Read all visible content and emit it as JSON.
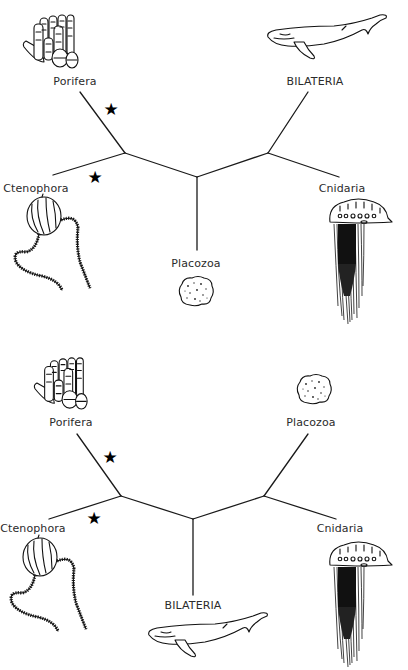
{
  "figure": {
    "type": "unrooted phylogenetic trees",
    "panels": [
      {
        "id": "top",
        "taxa": {
          "porifera": "Porifera",
          "ctenophora": "Ctenophora",
          "placozoa": "Placozoa",
          "bilateria": "BILATERIA",
          "cnidaria": "Cnidaria"
        },
        "topology": "((Porifera, Ctenophora), Placozoa, (BILATERIA, Cnidaria))",
        "markers": [
          {
            "symbol": "★",
            "branch": "Porifera"
          },
          {
            "symbol": "★",
            "branch": "Ctenophora"
          }
        ]
      },
      {
        "id": "bottom",
        "taxa": {
          "porifera": "Porifera",
          "ctenophora": "Ctenophora",
          "placozoa": "Placozoa",
          "bilateria": "BILATERIA",
          "cnidaria": "Cnidaria"
        },
        "topology": "((Porifera, Ctenophora), BILATERIA, (Placozoa, Cnidaria))",
        "markers": [
          {
            "symbol": "★",
            "branch": "Porifera"
          },
          {
            "symbol": "★",
            "branch": "Ctenophora"
          }
        ]
      }
    ],
    "illustrations": [
      "sponge-icon",
      "comb-jelly-icon",
      "placozoan-icon",
      "whale-icon",
      "man-o-war-icon"
    ],
    "colors": {
      "ink": "#1a1a1a",
      "label": "#2b2b2b",
      "background": "#ffffff"
    }
  }
}
